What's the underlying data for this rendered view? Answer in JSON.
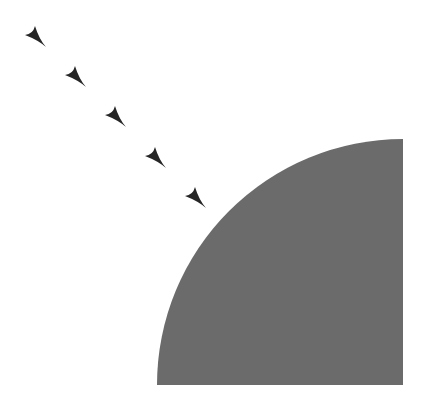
{
  "diagram": {
    "canvas": {
      "width": 425,
      "height": 404,
      "background": "#ffffff"
    },
    "quarter_disc": {
      "description": "quarter circle, right angle at bottom-right",
      "center_x": 403,
      "center_y": 385,
      "radius": 246,
      "fill": "#6b6b6b"
    },
    "arrows": {
      "description": "dart-shaped arrowheads pointing toward the quarter disc",
      "fill": "#262626",
      "direction": "down-right",
      "items": [
        {
          "x": 36,
          "y": 37
        },
        {
          "x": 76,
          "y": 77
        },
        {
          "x": 116,
          "y": 117
        },
        {
          "x": 156,
          "y": 158
        },
        {
          "x": 196,
          "y": 198
        }
      ]
    }
  }
}
